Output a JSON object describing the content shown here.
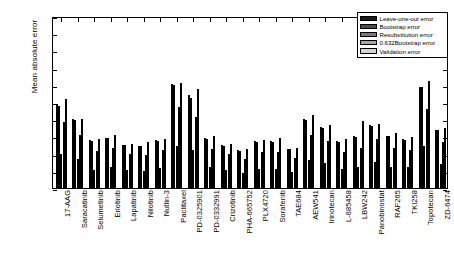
{
  "chart_data": {
    "type": "bar",
    "title": "",
    "xlabel": "",
    "ylabel": "Mean absolute error",
    "ylim": [
      0,
      0.2
    ],
    "ytick_labels": [
      "0",
      "0.02",
      "0.04",
      "0.06",
      "0.08",
      "0.1",
      "0.12",
      "0.14",
      "0.16",
      "0.18",
      "0.2"
    ],
    "ytick_values": [
      0,
      0.02,
      0.04,
      0.06,
      0.08,
      0.1,
      0.12,
      0.14,
      0.16,
      0.18,
      0.2
    ],
    "grid": false,
    "legend_position": "top-right",
    "categories": [
      "17-AAG",
      "Saracatinib",
      "Selumetinib",
      "Erlotinib",
      "Lapatinib",
      "Nilotinib",
      "Nutlin-3",
      "Paclitaxel",
      "PD-0325901",
      "PD-0332991",
      "Crizotinib",
      "PHA-665752",
      "PLX4720",
      "Sorafenib",
      "TAE684",
      "AEW541",
      "Irinotecan",
      "L-685458",
      "LBW242",
      "Panobinostat",
      "RAF265",
      "TKI258",
      "Topotecan",
      "ZD-6474"
    ],
    "series": [
      {
        "name": "Leave-one-out error",
        "color": "#1a1a1a",
        "values": [
          0.098,
          0.08,
          0.056,
          0.058,
          0.05,
          0.049,
          0.056,
          0.121,
          0.108,
          0.058,
          0.05,
          0.044,
          0.055,
          0.055,
          0.045,
          0.08,
          0.071,
          0.055,
          0.06,
          0.073,
          0.061,
          0.057,
          0.118,
          0.068
        ]
      },
      {
        "name": "Bootstrap error",
        "color": "#4d4d4d",
        "values": [
          0.095,
          0.079,
          0.055,
          0.058,
          0.05,
          0.049,
          0.055,
          0.12,
          0.105,
          0.057,
          0.049,
          0.043,
          0.054,
          0.054,
          0.045,
          0.079,
          0.07,
          0.054,
          0.059,
          0.072,
          0.06,
          0.056,
          0.117,
          0.067
        ]
      },
      {
        "name": "Resubstitution error",
        "color": "#7a7a7a",
        "values": [
          0.039,
          0.034,
          0.021,
          0.024,
          0.021,
          0.02,
          0.023,
          0.049,
          0.044,
          0.024,
          0.021,
          0.018,
          0.022,
          0.022,
          0.019,
          0.033,
          0.029,
          0.022,
          0.025,
          0.03,
          0.025,
          0.024,
          0.049,
          0.028
        ]
      },
      {
        "name": "0.632Bootstrap error",
        "color": "#a6a6a6",
        "values": [
          0.077,
          0.062,
          0.043,
          0.046,
          0.039,
          0.038,
          0.044,
          0.094,
          0.083,
          0.045,
          0.039,
          0.034,
          0.042,
          0.042,
          0.035,
          0.062,
          0.055,
          0.042,
          0.046,
          0.057,
          0.047,
          0.044,
          0.092,
          0.053
        ]
      },
      {
        "name": "Validation error",
        "color": "#d4d4d4",
        "values": [
          0.104,
          0.08,
          0.057,
          0.062,
          0.051,
          0.053,
          0.057,
          0.122,
          0.115,
          0.06,
          0.051,
          0.045,
          0.056,
          0.058,
          0.047,
          0.085,
          0.073,
          0.057,
          0.078,
          0.075,
          0.064,
          0.059,
          0.124,
          0.07
        ]
      }
    ]
  }
}
